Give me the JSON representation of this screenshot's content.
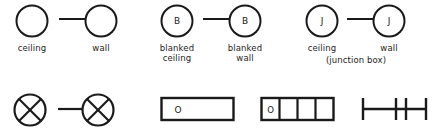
{
  "sheet": {
    "title": "Electrical outlet symbol legend",
    "ink_color": "#1a1a1a",
    "background_color": "#ffffff"
  },
  "rows": {
    "top": {
      "groups": [
        {
          "id": "plain-outlet",
          "ceiling_symbol": "empty-circle",
          "wall_symbol": "empty-circle-with-lead",
          "letter": "",
          "labels": {
            "ceiling": "ceiling",
            "wall": "wall"
          }
        },
        {
          "id": "blanked-outlet",
          "ceiling_symbol": "lettered-circle",
          "wall_symbol": "lettered-circle-with-lead",
          "letter": "B",
          "labels": {
            "ceiling_line1": "blanked",
            "ceiling_line2": "ceiling",
            "wall_line1": "blanked",
            "wall_line2": "wall"
          }
        },
        {
          "id": "junction-box-outlet",
          "ceiling_symbol": "lettered-circle",
          "wall_symbol": "lettered-circle-with-lead",
          "letter": "J",
          "labels": {
            "ceiling": "ceiling",
            "wall": "wall",
            "note": "(junction box)"
          }
        }
      ]
    },
    "bottom": {
      "groups": [
        {
          "id": "crossed-outlet-pair",
          "symbol": "crossed-circle-pair",
          "letter": ""
        },
        {
          "id": "single-outlet-box",
          "symbol": "rectangle-with-letter",
          "letter": "O",
          "cells": 1
        },
        {
          "id": "multi-outlet-box",
          "symbol": "segmented-rectangle-with-letter",
          "letter": "O",
          "cells": 4
        },
        {
          "id": "busway-run",
          "symbol": "line-with-ticks",
          "ticks": 4
        }
      ]
    }
  }
}
